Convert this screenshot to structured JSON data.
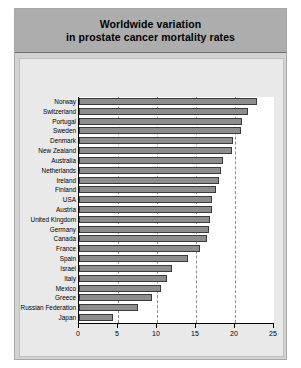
{
  "title": {
    "line1": "Worldwide variation",
    "line2": "in prostate cancer mortality rates"
  },
  "colors": {
    "figure_background": "#d2d2d2",
    "title_background": "#adadad",
    "plot_panel": "#e9e9e9",
    "axes_background": "#ffffff",
    "bar_fill": "#8d8d8d",
    "bar_border": "#3a3a3a",
    "gridline": "#8e8e8e",
    "axis_line": "#000000"
  },
  "chart_data": {
    "type": "bar",
    "orientation": "horizontal",
    "title": "Worldwide variation in prostate cancer mortality rates",
    "xlabel": "",
    "ylabel": "",
    "xlim": [
      0,
      25
    ],
    "xticks": [
      0,
      5,
      10,
      15,
      20,
      25
    ],
    "xticklabels": [
      "0",
      "5",
      "10",
      "15",
      "20",
      "25"
    ],
    "grid": "vertical dashed gridlines at 5, 10, 15, 20",
    "legend": "none",
    "categories": [
      "Norway",
      "Switzerland",
      "Portugal",
      "Sweden",
      "Denmark",
      "New Zealand",
      "Australia",
      "Netherlands",
      "Ireland",
      "Finland",
      "USA",
      "Austria",
      "United Kingdom",
      "Germany",
      "Canada",
      "France",
      "Spain",
      "Israel",
      "Italy",
      "Mexico",
      "Greece",
      "Russian Federation",
      "Japan"
    ],
    "values": [
      22.8,
      21.7,
      20.9,
      20.8,
      19.7,
      19.6,
      18.4,
      18.2,
      17.9,
      17.6,
      17.0,
      17.0,
      16.8,
      16.7,
      16.4,
      15.5,
      14.0,
      11.9,
      11.3,
      10.5,
      9.4,
      7.6,
      4.3
    ]
  }
}
